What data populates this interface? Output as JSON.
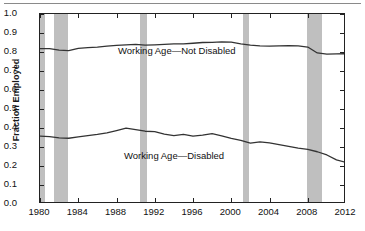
{
  "figure": {
    "y_axis_title": "Fraction Employed"
  },
  "chart_data": {
    "type": "line",
    "title": "",
    "xlabel": "",
    "ylabel": "Fraction Employed",
    "xlim": [
      1980,
      2012
    ],
    "ylim": [
      0.0,
      1.0
    ],
    "grid": false,
    "legend": "inline-annotations",
    "xticks": [
      1980,
      1984,
      1988,
      1992,
      1996,
      2000,
      2004,
      2008,
      2012
    ],
    "xtick_labels": [
      "1980",
      "1984",
      "1988",
      "1992",
      "1996",
      "2000",
      "2004",
      "2008",
      "2012"
    ],
    "yticks": [
      0.0,
      0.1,
      0.2,
      0.3,
      0.4,
      0.5,
      0.6,
      0.7,
      0.8,
      0.9,
      1.0
    ],
    "ytick_labels": [
      "0.0",
      "0.1",
      "0.2",
      "0.3",
      "0.4",
      "0.5",
      "0.6",
      "0.7",
      "0.8",
      "0.9",
      "1.0"
    ],
    "line_color": "#333333",
    "shading_color": "#bfbfbf",
    "shaded_regions": [
      {
        "label": "recession-1980",
        "start": 1980.0,
        "end": 1980.55
      },
      {
        "label": "recession-1981-1982",
        "start": 1981.5,
        "end": 1982.9
      },
      {
        "label": "recession-1990-1991",
        "start": 1990.5,
        "end": 1991.2
      },
      {
        "label": "recession-2001",
        "start": 2001.2,
        "end": 2001.9
      },
      {
        "label": "recession-2007-2009",
        "start": 2007.9,
        "end": 2009.45
      }
    ],
    "x": [
      1980,
      1981,
      1982,
      1983,
      1984,
      1985,
      1986,
      1987,
      1988,
      1989,
      1990,
      1991,
      1992,
      1993,
      1994,
      1995,
      1996,
      1997,
      1998,
      1999,
      2000,
      2001,
      2002,
      2003,
      2004,
      2005,
      2006,
      2007,
      2008,
      2009,
      2010,
      2011,
      2012
    ],
    "series": [
      {
        "name": "Working Age—Not Disabled",
        "annotation": "Working Age—Not Disabled",
        "values": [
          0.818,
          0.818,
          0.81,
          0.807,
          0.819,
          0.823,
          0.826,
          0.831,
          0.835,
          0.838,
          0.84,
          0.836,
          0.838,
          0.84,
          0.843,
          0.843,
          0.846,
          0.85,
          0.851,
          0.853,
          0.852,
          0.843,
          0.836,
          0.832,
          0.831,
          0.832,
          0.833,
          0.832,
          0.826,
          0.795,
          0.789,
          0.79,
          0.791
        ]
      },
      {
        "name": "Working Age—Disabled",
        "annotation": "Working Age—Disabled",
        "values": [
          0.357,
          0.355,
          0.348,
          0.346,
          0.353,
          0.36,
          0.366,
          0.374,
          0.386,
          0.399,
          0.391,
          0.383,
          0.381,
          0.368,
          0.36,
          0.366,
          0.357,
          0.362,
          0.37,
          0.359,
          0.345,
          0.335,
          0.32,
          0.327,
          0.322,
          0.313,
          0.303,
          0.294,
          0.288,
          0.275,
          0.258,
          0.232,
          0.219
        ]
      }
    ],
    "annotations": [
      {
        "text": "Working Age—Not Disabled",
        "x": 1988.0,
        "y": 0.79
      },
      {
        "text": "Working Age—Disabled",
        "x": 1988.5,
        "y": 0.245
      }
    ]
  }
}
